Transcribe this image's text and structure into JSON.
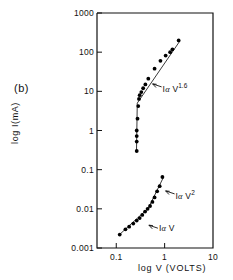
{
  "panel": {
    "label": "(b)"
  },
  "chart_data": {
    "type": "scatter",
    "title": "",
    "xlabel": "log V (VOLTS)",
    "ylabel": "log I(mA)",
    "xscale": "log",
    "yscale": "log",
    "xlim": [
      0.04,
      10
    ],
    "ylim": [
      0.001,
      1000
    ],
    "grid": false,
    "legend": "none",
    "xticks": [
      0.1,
      1,
      10
    ],
    "xtick_labels": [
      "0.1",
      "1",
      "10"
    ],
    "yticks": [
      0.001,
      0.01,
      0.1,
      1,
      10,
      100,
      1000
    ],
    "ytick_labels": [
      "0.001",
      "0.01",
      "0.1",
      "1",
      "10",
      "100",
      "1000"
    ],
    "annotations": [
      {
        "id": "upper-slope",
        "text_prefix": "I",
        "text_alpha": "α",
        "text_var": "V",
        "exponent": "1.6",
        "x": 0.62,
        "y": 13
      },
      {
        "id": "lower-slope-sq",
        "text_prefix": "I",
        "text_alpha": "α",
        "text_var": "V",
        "exponent": "2",
        "x": 1.15,
        "y": 0.024
      },
      {
        "id": "lower-slope-lin",
        "text_prefix": "I",
        "text_alpha": "α",
        "text_var": "V",
        "exponent": "",
        "x": 0.52,
        "y": 0.0032
      }
    ],
    "series": [
      {
        "name": "upper-branch",
        "marker": "filled-circle",
        "points": [
          [
            0.265,
            0.3
          ],
          [
            0.265,
            0.52
          ],
          [
            0.265,
            0.72
          ],
          [
            0.265,
            1.0
          ],
          [
            0.275,
            2.0
          ],
          [
            0.285,
            4.2
          ],
          [
            0.295,
            6.4
          ],
          [
            0.305,
            8.0
          ],
          [
            0.33,
            9.6
          ],
          [
            0.36,
            12.0
          ],
          [
            0.4,
            15.0
          ],
          [
            0.46,
            21.0
          ],
          [
            0.62,
            38.0
          ],
          [
            0.82,
            60.0
          ],
          [
            1.05,
            82.0
          ],
          [
            1.3,
            100.0
          ],
          [
            1.45,
            118.0
          ],
          [
            1.95,
            200.0
          ]
        ]
      },
      {
        "name": "lower-branch",
        "marker": "filled-circle",
        "points": [
          [
            0.118,
            0.0022
          ],
          [
            0.155,
            0.003
          ],
          [
            0.185,
            0.0035
          ],
          [
            0.225,
            0.0042
          ],
          [
            0.265,
            0.005
          ],
          [
            0.305,
            0.0058
          ],
          [
            0.345,
            0.007
          ],
          [
            0.395,
            0.0085
          ],
          [
            0.445,
            0.01
          ],
          [
            0.5,
            0.0118
          ],
          [
            0.56,
            0.015
          ],
          [
            0.62,
            0.0195
          ],
          [
            0.7,
            0.028
          ],
          [
            0.79,
            0.038
          ],
          [
            0.9,
            0.065
          ]
        ]
      }
    ],
    "fit_lines": [
      {
        "name": "upper-riser",
        "points": [
          [
            0.262,
            0.3
          ],
          [
            0.272,
            5.0
          ]
        ]
      },
      {
        "name": "upper-fit-1.6",
        "points": [
          [
            0.272,
            5.0
          ],
          [
            2.05,
            190.0
          ]
        ]
      },
      {
        "name": "lower-fit-linear",
        "points": [
          [
            0.112,
            0.0021
          ],
          [
            0.46,
            0.0104
          ]
        ]
      },
      {
        "name": "lower-fit-square",
        "points": [
          [
            0.46,
            0.0104
          ],
          [
            0.94,
            0.063
          ]
        ]
      }
    ]
  }
}
